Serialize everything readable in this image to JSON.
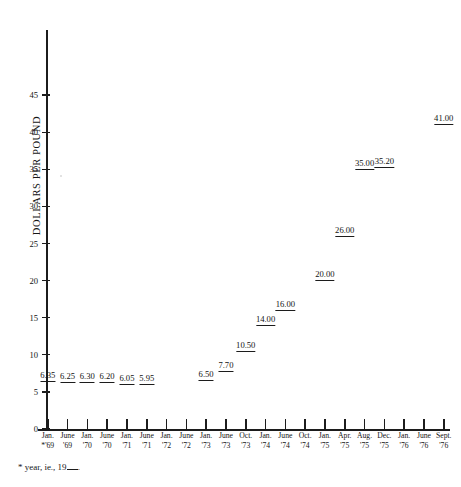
{
  "chart_data": {
    "type": "scatter",
    "title": "",
    "xlabel": "",
    "ylabel": "DOLLARS PER POUND",
    "ylim": [
      0,
      46
    ],
    "yticks": [
      0,
      5,
      10,
      15,
      20,
      25,
      30,
      35,
      40,
      45
    ],
    "ytick_labels": [
      "0",
      "5",
      "10",
      "15",
      "20",
      "25",
      "30",
      "35",
      "40",
      "45"
    ],
    "grid": false,
    "legend": null,
    "footnote": "* year, ie., 19",
    "footnote_suffix": ".",
    "categories": [
      "Jan. *'69",
      "June '69",
      "Jan. '70",
      "June '70",
      "Jan. '71",
      "June '71",
      "Jan. '72",
      "June '72",
      "Jan. '73",
      "June '73",
      "Oct. '73",
      "Jan. '74",
      "June '74",
      "Oct. '74",
      "Jan. '75",
      "Apr. '75",
      "Aug. '75",
      "Dec. '75",
      "Jan. '76",
      "June '76",
      "Sept. '76"
    ],
    "values": [
      6.35,
      6.25,
      6.3,
      6.2,
      6.05,
      5.95,
      null,
      null,
      6.5,
      7.7,
      10.5,
      14.0,
      16.0,
      null,
      20.0,
      26.0,
      35.0,
      35.2,
      null,
      null,
      41.0
    ],
    "data_labels": [
      "6.35",
      "6.25",
      "6.30",
      "6.20",
      "6.05",
      "5.95",
      "6.50",
      "7.70",
      "10.50",
      "14.00",
      "16.00",
      "20.00",
      "26.00",
      "35.00",
      "35.20",
      "41.00"
    ],
    "points": [
      {
        "month": "Jan.",
        "year": "*'69",
        "value": 6.35,
        "label": "6.35"
      },
      {
        "month": "June",
        "year": "'69",
        "value": 6.25,
        "label": "6.25"
      },
      {
        "month": "Jan.",
        "year": "'70",
        "value": 6.3,
        "label": "6.30"
      },
      {
        "month": "June",
        "year": "'70",
        "value": 6.2,
        "label": "6.20"
      },
      {
        "month": "Jan.",
        "year": "'71",
        "value": 6.05,
        "label": "6.05"
      },
      {
        "month": "June",
        "year": "'71",
        "value": 5.95,
        "label": "5.95"
      },
      {
        "month": "Jan.",
        "year": "'72",
        "value": null,
        "label": ""
      },
      {
        "month": "June",
        "year": "'72",
        "value": null,
        "label": ""
      },
      {
        "month": "Jan.",
        "year": "'73",
        "value": 6.5,
        "label": "6.50"
      },
      {
        "month": "June",
        "year": "'73",
        "value": 7.7,
        "label": "7.70"
      },
      {
        "month": "Oct.",
        "year": "'73",
        "value": 10.5,
        "label": "10.50"
      },
      {
        "month": "Jan.",
        "year": "'74",
        "value": 14.0,
        "label": "14.00"
      },
      {
        "month": "June",
        "year": "'74",
        "value": 16.0,
        "label": "16.00"
      },
      {
        "month": "Oct.",
        "year": "'74",
        "value": null,
        "label": ""
      },
      {
        "month": "Jan.",
        "year": "'75",
        "value": 20.0,
        "label": "20.00"
      },
      {
        "month": "Apr.",
        "year": "'75",
        "value": 26.0,
        "label": "26.00"
      },
      {
        "month": "Aug.",
        "year": "'75",
        "value": 35.0,
        "label": "35.00"
      },
      {
        "month": "Dec.",
        "year": "'75",
        "value": 35.2,
        "label": "35.20"
      },
      {
        "month": "Jan.",
        "year": "'76",
        "value": null,
        "label": ""
      },
      {
        "month": "June",
        "year": "'76",
        "value": null,
        "label": ""
      },
      {
        "month": "Sept.",
        "year": "'76",
        "value": 41.0,
        "label": "41.00"
      }
    ]
  },
  "colors": {
    "ink": "#1c1c1c",
    "background": "#ffffff"
  }
}
